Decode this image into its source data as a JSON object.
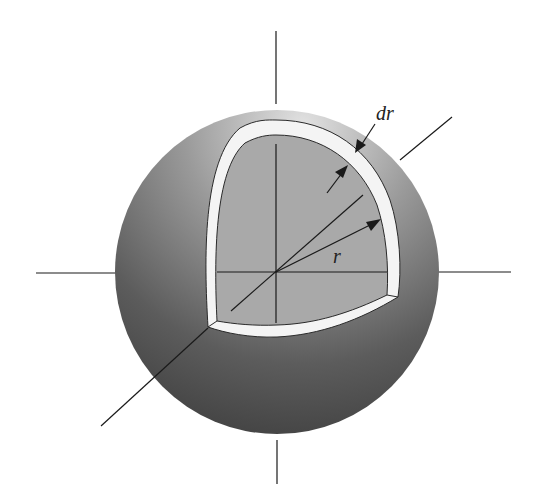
{
  "figure": {
    "labels": {
      "shell_thickness": "dr",
      "radius": "r"
    },
    "colors": {
      "background": "#ffffff",
      "sphere_light": "#d6d6d6",
      "sphere_dark": "#4a4a4a",
      "cutaway_face": "#a8a8a8",
      "shell": "#f4f4f4",
      "lines": "#1a1a1a"
    }
  }
}
